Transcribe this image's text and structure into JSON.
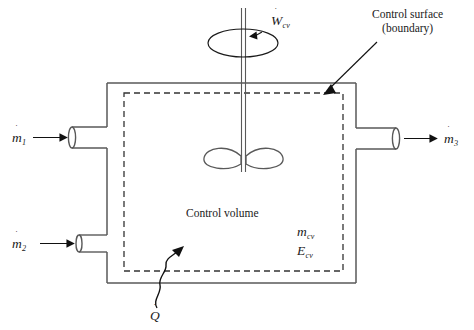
{
  "figure": {
    "type": "thermodynamics-control-volume-diagram",
    "background_color": "#ffffff",
    "line_color": "#4d4d4d",
    "boundary_color": "#333333",
    "text_color": "#1a1a1a"
  },
  "labels": {
    "work_symbol": "W",
    "work_subscript": "cv",
    "work_dot": "˙",
    "heat_symbol": "Q",
    "heat_dot": "˙",
    "mass_symbol": "m",
    "mass_dot": "˙",
    "inlet1_subscript": "1",
    "inlet2_subscript": "2",
    "outlet3_subscript": "3",
    "control_volume": "Control volume",
    "control_surface_line1": "Control surface",
    "control_surface_line2": "(boundary)",
    "mass_cv_symbol": "m",
    "mass_cv_subscript": "cv",
    "energy_cv_symbol": "E",
    "energy_cv_subscript": "cv"
  },
  "elements": {
    "shaft": "rotating-shaft",
    "impeller": "two-blade-propeller",
    "rotation_indicator": "ellipse-with-arrow",
    "inlet_pipe_1": "inlet-duct",
    "inlet_pipe_2": "inlet-duct",
    "outlet_pipe_3": "outlet-duct",
    "heat_arrow": "wavy-arrow",
    "leader_line": "pointer-to-boundary"
  },
  "geometry": {
    "tank_left": 107,
    "tank_right": 356,
    "tank_top": 83,
    "tank_bottom": 283,
    "boundary_left": 124,
    "boundary_right": 343,
    "boundary_top": 93,
    "boundary_bottom": 271
  }
}
